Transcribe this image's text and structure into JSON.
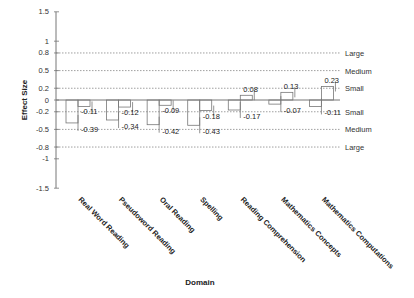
{
  "chart_data": {
    "type": "bar",
    "title": "",
    "xlabel": "Domain",
    "ylabel": "Effect Size",
    "ylim": [
      -1.5,
      1.5
    ],
    "yticks": [
      1.5,
      1,
      0.8,
      0.5,
      0.2,
      0,
      -0.2,
      -0.5,
      -0.8,
      -1,
      -1.5
    ],
    "categories": [
      "Real Word Reading",
      "Pseudoword Reading",
      "Oral Reading",
      "Spelling",
      "Reading Comprehension",
      "Mathematics Concepts",
      "Mathematics Computations"
    ],
    "series": [
      {
        "name": "Series 1",
        "values": [
          -0.11,
          -0.12,
          -0.09,
          -0.18,
          0.08,
          0.13,
          0.23
        ]
      },
      {
        "name": "Series 2",
        "values": [
          -0.39,
          -0.34,
          -0.42,
          -0.43,
          -0.17,
          -0.07,
          -0.11
        ]
      }
    ],
    "reference_lines": [
      {
        "value": 0.8,
        "label": "Large"
      },
      {
        "value": 0.5,
        "label": "Medium"
      },
      {
        "value": 0.2,
        "label": "Small"
      },
      {
        "value": -0.2,
        "label": "Small"
      },
      {
        "value": -0.5,
        "label": "Medium"
      },
      {
        "value": -0.8,
        "label": "Large"
      }
    ],
    "grid": false,
    "legend": "none"
  }
}
